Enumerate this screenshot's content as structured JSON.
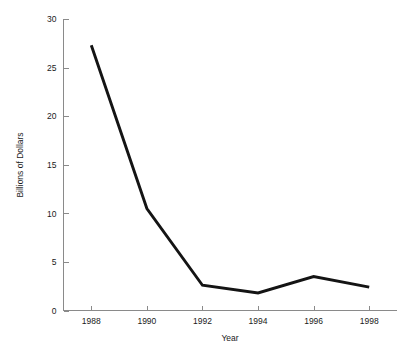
{
  "chart_data": {
    "type": "line",
    "title": "",
    "xlabel": "Year",
    "ylabel": "Billions of Dollars",
    "categories": [
      "1988",
      "1990",
      "1992",
      "1994",
      "1996",
      "1998"
    ],
    "x": [
      1988,
      1990,
      1992,
      1994,
      1996,
      1998
    ],
    "values": [
      27.3,
      10.5,
      2.6,
      1.8,
      3.5,
      2.4
    ],
    "series": [
      {
        "name": "Billions of Dollars",
        "values": [
          27.3,
          10.5,
          2.6,
          1.8,
          3.5,
          2.4
        ]
      }
    ],
    "xlim": [
      1987.0,
      1999.0
    ],
    "ylim": [
      0,
      30
    ],
    "xticks": [
      1988,
      1990,
      1992,
      1994,
      1996,
      1998
    ],
    "xtick_labels": [
      "1988",
      "1990",
      "1992",
      "1994",
      "1996",
      "1998"
    ],
    "yticks": [
      0,
      5,
      10,
      15,
      20,
      25,
      30
    ],
    "ytick_labels": [
      "0",
      "5",
      "10",
      "15",
      "20",
      "25",
      "30"
    ],
    "grid": false,
    "legend": false,
    "legend_position": "none",
    "line_color": "#141414",
    "axis_color": "#8a8a8a",
    "background_color": "#ffffff"
  }
}
